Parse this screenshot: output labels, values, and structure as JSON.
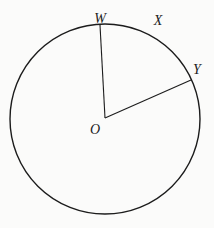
{
  "diagram": {
    "background_color": "#fbfbfa",
    "stroke_color": "#1c1c1c",
    "label_color": "#1c1c1c",
    "labels": {
      "center": "O",
      "point_w": "W",
      "point_x": "X",
      "point_y": "Y"
    }
  }
}
